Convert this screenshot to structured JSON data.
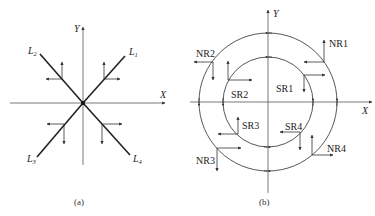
{
  "panel_a": {
    "caption": "(a)",
    "axis_x": "X",
    "axis_y": "Y",
    "lines": [
      {
        "name": "L",
        "sub": "1"
      },
      {
        "name": "L",
        "sub": "2"
      },
      {
        "name": "L",
        "sub": "3"
      },
      {
        "name": "L",
        "sub": "4"
      }
    ]
  },
  "panel_b": {
    "caption": "(b)",
    "axis_x": "X",
    "axis_y": "Y",
    "regions": {
      "sr1": "SR1",
      "sr2": "SR2",
      "sr3": "SR3",
      "sr4": "SR4",
      "nr1": "NR1",
      "nr2": "NR2",
      "nr3": "NR3",
      "nr4": "NR4"
    }
  }
}
